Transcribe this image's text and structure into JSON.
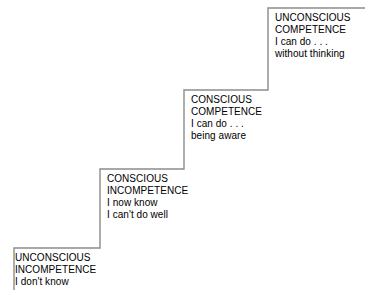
{
  "diagram": {
    "type": "staircase-diagram",
    "line_color": "#8c8c8c",
    "text_color": "#000000",
    "background_color": "#ffffff",
    "steps": [
      {
        "id": "unconscious-incompetence",
        "order": 1,
        "heading_line_1": "UNCONSCIOUS",
        "heading_line_2": "INCOMPETENCE",
        "body_line_1": "I don't know",
        "body_line_2": ""
      },
      {
        "id": "conscious-incompetence",
        "order": 2,
        "heading_line_1": "CONSCIOUS",
        "heading_line_2": "INCOMPETENCE",
        "body_line_1": "I now know",
        "body_line_2": "I can't do well"
      },
      {
        "id": "conscious-competence",
        "order": 3,
        "heading_line_1": "CONSCIOUS",
        "heading_line_2": "COMPETENCE",
        "body_line_1": "I can do . . .",
        "body_line_2": "being aware"
      },
      {
        "id": "unconscious-competence",
        "order": 4,
        "heading_line_1": "UNCONSCIOUS",
        "heading_line_2": "COMPETENCE",
        "body_line_1": "I can do . . .",
        "body_line_2": "without thinking"
      }
    ]
  }
}
